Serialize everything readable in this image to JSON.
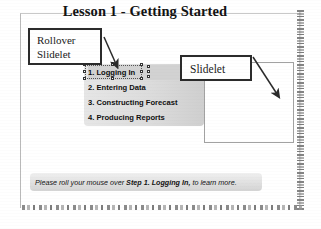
{
  "slide": {
    "title": "Lesson 1 - Getting Started"
  },
  "callouts": {
    "rollover": {
      "line1": "Rollover",
      "line2": "Slidelet",
      "icon": "callout-box"
    },
    "slidelet": {
      "label": "Slidelet",
      "icon": "callout-box"
    }
  },
  "menu": {
    "items": [
      {
        "label": "1. Logging In",
        "selected": true
      },
      {
        "label": "2. Entering Data",
        "selected": false
      },
      {
        "label": "3. Constructing Forecast",
        "selected": false
      },
      {
        "label": "4. Producing Reports",
        "selected": false
      }
    ]
  },
  "selection": {
    "handle_icon": "resize-handle-icon",
    "handle_count": 8
  },
  "arrows": {
    "rollover_arrow_icon": "arrow-down-right-icon",
    "slidelet_arrow_icon": "arrow-down-right-icon"
  },
  "instruction": {
    "prefix": "Please roll your mouse over ",
    "bold": "Step 1. Logging In,",
    "suffix": " to learn more."
  },
  "colors": {
    "page_background": "#ffffff",
    "callout_border": "#2b2b2b",
    "menu_panel_light": "#e6e6e6",
    "menu_panel_dark": "#cfcfcf",
    "slidelet_rect_border": "#a2a2a2",
    "instruction_bar": "#e3e3e3",
    "text": "#131313"
  }
}
